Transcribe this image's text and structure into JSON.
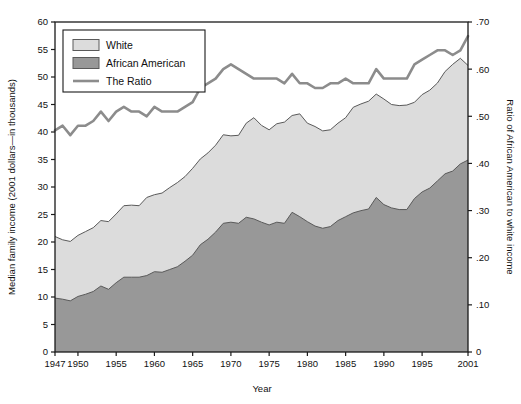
{
  "chart_data": {
    "type": "area",
    "title": "",
    "xlabel": "Year",
    "ylabel": "Median family income (2001 dollars—in thousands)",
    "y2label": "Ratio of African American to white income",
    "xlim": [
      1947,
      2001
    ],
    "ylim": [
      0,
      60
    ],
    "y2lim": [
      0,
      0.7
    ],
    "grid": true,
    "legend_position": "top-left",
    "ytick_labels": [
      "0",
      "5",
      "10",
      "15",
      "20",
      "25",
      "30",
      "35",
      "40",
      "45",
      "50",
      "55",
      "60"
    ],
    "ytick_values": [
      0,
      5,
      10,
      15,
      20,
      25,
      30,
      35,
      40,
      45,
      50,
      55,
      60
    ],
    "y2tick_labels": [
      "0",
      ".10",
      ".20",
      ".30",
      ".40",
      ".50",
      ".60",
      ".70"
    ],
    "y2tick_values": [
      0,
      0.1,
      0.2,
      0.3,
      0.4,
      0.5,
      0.6,
      0.7
    ],
    "xtick_labels": [
      "1947",
      "1950",
      "1955",
      "1960",
      "1965",
      "1970",
      "1975",
      "1980",
      "1985",
      "1990",
      "1995",
      "2001"
    ],
    "xtick_values": [
      1947,
      1950,
      1955,
      1960,
      1965,
      1970,
      1975,
      1980,
      1985,
      1990,
      1995,
      2001
    ],
    "x": [
      1947,
      1948,
      1949,
      1950,
      1951,
      1952,
      1953,
      1954,
      1955,
      1956,
      1957,
      1958,
      1959,
      1960,
      1961,
      1962,
      1963,
      1964,
      1965,
      1966,
      1967,
      1968,
      1969,
      1970,
      1971,
      1972,
      1973,
      1974,
      1975,
      1976,
      1977,
      1978,
      1979,
      1980,
      1981,
      1982,
      1983,
      1984,
      1985,
      1986,
      1987,
      1988,
      1989,
      1990,
      1991,
      1992,
      1993,
      1994,
      1995,
      1996,
      1997,
      1998,
      1999,
      2000,
      2001
    ],
    "series": [
      {
        "name": "White",
        "axis": "left",
        "color": "#dcdcdc",
        "values": [
          21.0,
          20.4,
          20.1,
          21.2,
          21.9,
          22.6,
          23.9,
          23.7,
          25.1,
          26.6,
          26.7,
          26.6,
          28.1,
          28.6,
          28.9,
          29.9,
          30.8,
          31.9,
          33.4,
          35.1,
          36.2,
          37.6,
          39.5,
          39.3,
          39.4,
          41.6,
          42.6,
          41.2,
          40.4,
          41.5,
          41.8,
          43.0,
          43.3,
          41.6,
          41.0,
          40.2,
          40.4,
          41.6,
          42.6,
          44.5,
          45.1,
          45.6,
          46.9,
          46.0,
          45.0,
          44.8,
          44.9,
          45.4,
          46.8,
          47.6,
          48.9,
          51.0,
          52.3,
          53.4,
          52.1
        ]
      },
      {
        "name": "African American",
        "axis": "left",
        "color": "#989898",
        "values": [
          9.8,
          9.6,
          9.3,
          10.1,
          10.5,
          11.0,
          12.0,
          11.4,
          12.6,
          13.6,
          13.6,
          13.6,
          13.9,
          14.6,
          14.5,
          15.0,
          15.5,
          16.5,
          17.6,
          19.5,
          20.5,
          21.8,
          23.4,
          23.6,
          23.4,
          24.5,
          24.2,
          23.6,
          23.1,
          23.6,
          23.4,
          25.4,
          24.6,
          23.7,
          22.9,
          22.5,
          22.8,
          23.9,
          24.6,
          25.3,
          25.7,
          26.0,
          28.1,
          26.8,
          26.2,
          25.9,
          25.9,
          27.9,
          29.1,
          29.8,
          31.1,
          32.4,
          32.9,
          34.2,
          34.9
        ]
      },
      {
        "name": "The Ratio",
        "axis": "right",
        "color": "#8c8c8c",
        "values": [
          0.47,
          0.48,
          0.46,
          0.48,
          0.48,
          0.49,
          0.51,
          0.49,
          0.51,
          0.52,
          0.51,
          0.51,
          0.5,
          0.52,
          0.51,
          0.51,
          0.51,
          0.52,
          0.53,
          0.56,
          0.57,
          0.58,
          0.6,
          0.61,
          0.6,
          0.59,
          0.58,
          0.58,
          0.58,
          0.58,
          0.57,
          0.59,
          0.57,
          0.57,
          0.56,
          0.56,
          0.57,
          0.57,
          0.58,
          0.57,
          0.57,
          0.57,
          0.6,
          0.58,
          0.58,
          0.58,
          0.58,
          0.61,
          0.62,
          0.63,
          0.64,
          0.64,
          0.63,
          0.64,
          0.67
        ]
      }
    ],
    "legend": [
      {
        "label": "White",
        "type": "swatch",
        "color": "#dcdcdc"
      },
      {
        "label": "African American",
        "type": "swatch",
        "color": "#989898"
      },
      {
        "label": "The Ratio",
        "type": "line",
        "color": "#8c8c8c"
      }
    ]
  }
}
